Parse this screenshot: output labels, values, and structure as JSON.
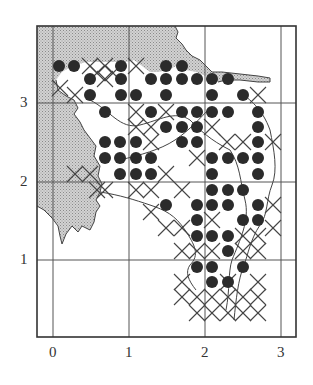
{
  "figure": {
    "type": "distribution grid map",
    "colors": {
      "frame": "#333333",
      "grid": "#555555",
      "shaded_land": "#c8c8c8",
      "dot": "#2b2b2b",
      "cross": "#444444",
      "coastline": "#444444"
    }
  },
  "axes": {
    "x_ticks": [
      {
        "label": "0",
        "px": 53
      },
      {
        "label": "1",
        "px": 129
      },
      {
        "label": "2",
        "px": 205
      },
      {
        "label": "3",
        "px": 281
      }
    ],
    "y_ticks": [
      {
        "label": "3",
        "py": 103
      },
      {
        "label": "2",
        "py": 182
      },
      {
        "label": "1",
        "py": 260
      }
    ]
  },
  "chart_data": {
    "type": "scatter",
    "title": "",
    "xlabel": "",
    "ylabel": "",
    "xlim": [
      -0.2,
      3.2
    ],
    "ylim": [
      0,
      4.0
    ],
    "grid": true,
    "x_tick_labels": [
      "0",
      "1",
      "2",
      "3"
    ],
    "y_tick_labels": [
      "1",
      "2",
      "3"
    ],
    "series": [
      {
        "name": "filled-circle-records",
        "marker": "filled-circle",
        "points_px": [
          [
            59,
            66
          ],
          [
            74,
            66
          ],
          [
            121,
            66
          ],
          [
            166,
            66
          ],
          [
            182,
            66
          ],
          [
            90,
            79
          ],
          [
            121,
            79
          ],
          [
            151,
            79
          ],
          [
            166,
            79
          ],
          [
            182,
            79
          ],
          [
            197,
            79
          ],
          [
            212,
            79
          ],
          [
            228,
            79
          ],
          [
            90,
            95
          ],
          [
            121,
            95
          ],
          [
            136,
            95
          ],
          [
            166,
            95
          ],
          [
            212,
            95
          ],
          [
            243,
            95
          ],
          [
            105,
            112
          ],
          [
            151,
            112
          ],
          [
            182,
            112
          ],
          [
            197,
            112
          ],
          [
            212,
            112
          ],
          [
            228,
            112
          ],
          [
            258,
            112
          ],
          [
            166,
            127
          ],
          [
            182,
            127
          ],
          [
            197,
            127
          ],
          [
            258,
            127
          ],
          [
            105,
            142
          ],
          [
            120,
            142
          ],
          [
            136,
            142
          ],
          [
            182,
            142
          ],
          [
            197,
            142
          ],
          [
            258,
            142
          ],
          [
            105,
            158
          ],
          [
            120,
            158
          ],
          [
            136,
            158
          ],
          [
            151,
            158
          ],
          [
            212,
            158
          ],
          [
            228,
            158
          ],
          [
            243,
            158
          ],
          [
            258,
            158
          ],
          [
            120,
            174
          ],
          [
            136,
            174
          ],
          [
            151,
            174
          ],
          [
            212,
            174
          ],
          [
            258,
            174
          ],
          [
            212,
            190
          ],
          [
            228,
            190
          ],
          [
            243,
            190
          ],
          [
            166,
            205
          ],
          [
            197,
            205
          ],
          [
            212,
            205
          ],
          [
            228,
            205
          ],
          [
            258,
            205
          ],
          [
            197,
            220
          ],
          [
            243,
            220
          ],
          [
            258,
            220
          ],
          [
            197,
            236
          ],
          [
            212,
            236
          ],
          [
            228,
            236
          ],
          [
            228,
            251
          ],
          [
            197,
            267
          ],
          [
            212,
            267
          ],
          [
            243,
            267
          ],
          [
            212,
            282
          ],
          [
            228,
            282
          ]
        ]
      },
      {
        "name": "cross-records",
        "marker": "x",
        "points_px": [
          [
            90,
            66
          ],
          [
            105,
            66
          ],
          [
            136,
            66
          ],
          [
            97,
            73
          ],
          [
            113,
            73
          ],
          [
            75,
            95
          ],
          [
            60,
            88
          ],
          [
            105,
            79
          ],
          [
            166,
            112
          ],
          [
            136,
            112
          ],
          [
            151,
            127
          ],
          [
            136,
            127
          ],
          [
            151,
            142
          ],
          [
            212,
            127
          ],
          [
            227,
            142
          ],
          [
            243,
            142
          ],
          [
            273,
            142
          ],
          [
            90,
            174
          ],
          [
            75,
            174
          ],
          [
            97,
            190
          ],
          [
            105,
            190
          ],
          [
            136,
            190
          ],
          [
            151,
            190
          ],
          [
            182,
            190
          ],
          [
            166,
            174
          ],
          [
            197,
            158
          ],
          [
            151,
            212
          ],
          [
            166,
            228
          ],
          [
            258,
            95
          ],
          [
            212,
            220
          ],
          [
            182,
            228
          ],
          [
            273,
            205
          ],
          [
            273,
            228
          ],
          [
            258,
            236
          ],
          [
            243,
            236
          ],
          [
            182,
            251
          ],
          [
            197,
            251
          ],
          [
            212,
            251
          ],
          [
            243,
            251
          ],
          [
            258,
            251
          ],
          [
            182,
            297
          ],
          [
            197,
            297
          ],
          [
            212,
            297
          ],
          [
            228,
            297
          ],
          [
            243,
            297
          ],
          [
            258,
            297
          ],
          [
            197,
            313
          ],
          [
            212,
            313
          ],
          [
            228,
            313
          ],
          [
            243,
            313
          ],
          [
            258,
            313
          ],
          [
            228,
            282
          ],
          [
            182,
            282
          ],
          [
            258,
            282
          ]
        ]
      }
    ]
  }
}
